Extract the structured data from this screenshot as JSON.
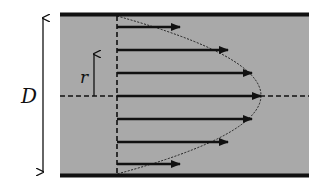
{
  "diagram": {
    "labels": {
      "diameter": "D",
      "radius": "r"
    },
    "colors": {
      "fluid": "#a9a9a9",
      "wall": "#111111",
      "arrow": "#111111",
      "background": "#ffffff"
    },
    "pipe": {
      "x_left": 60,
      "x_right": 309,
      "wall_top_y": 14.5,
      "wall_bottom_y": 175.5,
      "centerline_y": 96
    },
    "profile_origin_x": 117,
    "velocity_arrows": [
      {
        "y": 27,
        "end_x": 180
      },
      {
        "y": 50,
        "end_x": 228
      },
      {
        "y": 73,
        "end_x": 252
      },
      {
        "y": 96,
        "end_x": 261
      },
      {
        "y": 119,
        "end_x": 252
      },
      {
        "y": 142,
        "end_x": 228
      },
      {
        "y": 164,
        "end_x": 180
      }
    ]
  }
}
